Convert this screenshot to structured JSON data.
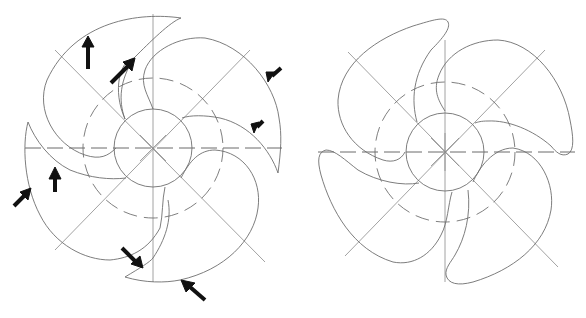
{
  "diagram": {
    "type": "fan-blade-technical-drawing",
    "figures": [
      {
        "id": "left",
        "description": "Four-blade fan with sharp-tipped blades; arrows indicate edges to modify",
        "blade_count": 4,
        "blade_tip_style": "sharp",
        "arrow_count": 8,
        "has_hub_circle": true,
        "has_dashed_pitch_circle": true,
        "has_center_lines": true
      },
      {
        "id": "right",
        "description": "Four-blade fan with rounded blade tips (modified design)",
        "blade_count": 4,
        "blade_tip_style": "rounded",
        "arrow_count": 0,
        "has_hub_circle": true,
        "has_dashed_pitch_circle": true,
        "has_center_lines": true
      }
    ],
    "colors": {
      "line": "#6e6e6e",
      "arrow": "#111111",
      "background": "#ffffff"
    }
  }
}
